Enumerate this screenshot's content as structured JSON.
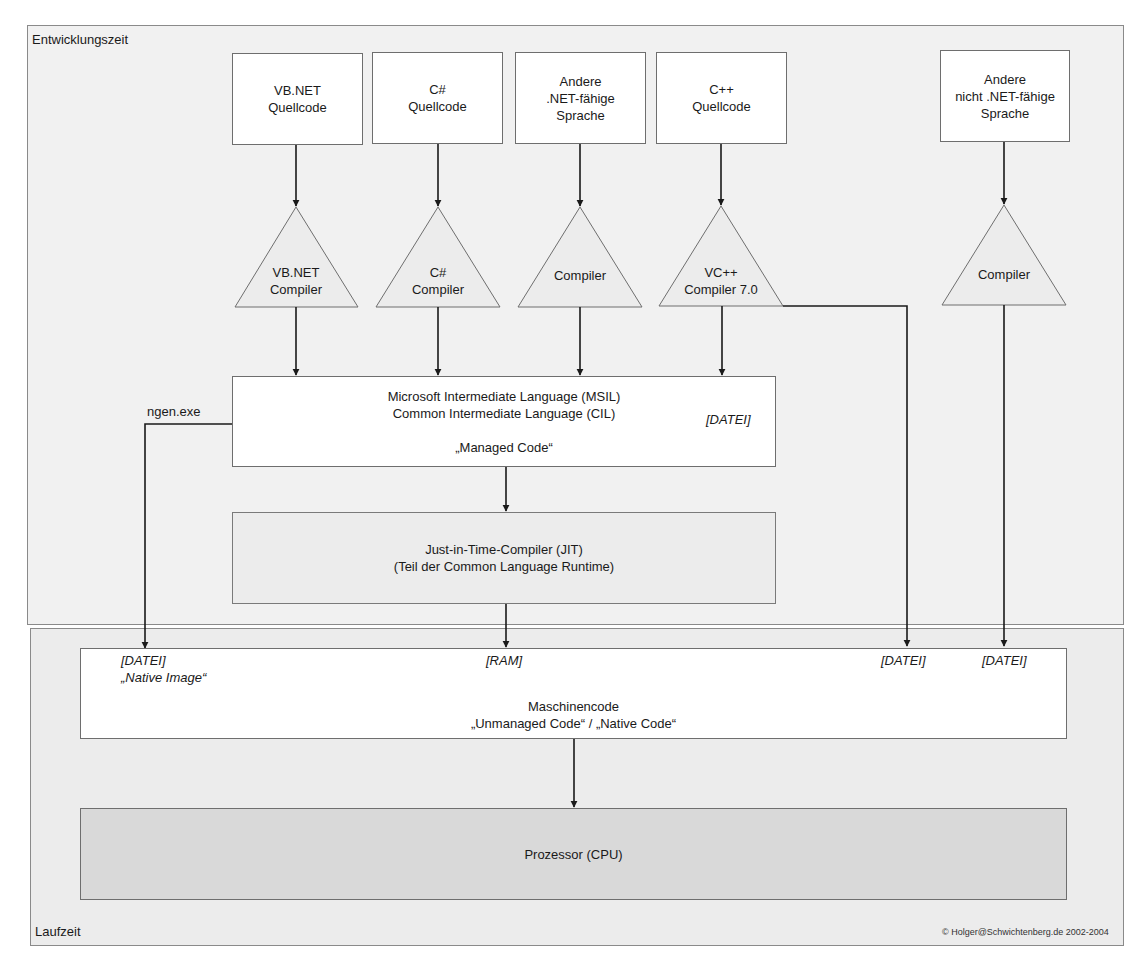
{
  "zones": {
    "development": {
      "label": "Entwicklungszeit"
    },
    "runtime": {
      "label": "Laufzeit"
    }
  },
  "sources": [
    {
      "lines": [
        "VB.NET",
        "Quellcode"
      ]
    },
    {
      "lines": [
        "C#",
        "Quellcode"
      ]
    },
    {
      "lines": [
        "Andere",
        ".NET-fähige",
        "Sprache"
      ]
    },
    {
      "lines": [
        "C++",
        "Quellcode"
      ]
    },
    {
      "lines": [
        "Andere",
        "nicht .NET-fähige",
        "Sprache"
      ]
    }
  ],
  "compilers": [
    {
      "lines": [
        "VB.NET",
        "Compiler"
      ]
    },
    {
      "lines": [
        "C#",
        "Compiler"
      ]
    },
    {
      "lines": [
        "Compiler"
      ]
    },
    {
      "lines": [
        "VC++",
        "Compiler 7.0"
      ]
    },
    {
      "lines": [
        "Compiler"
      ]
    }
  ],
  "msil": {
    "line1": "Microsoft Intermediate Language (MSIL)",
    "line2": "Common Intermediate Language (CIL)",
    "line3": "„Managed Code“",
    "tag": "[DATEI]"
  },
  "ngen_label": "ngen.exe",
  "jit": {
    "line1": "Just-in-Time-Compiler (JIT)",
    "line2": "(Teil der Common Language Runtime)"
  },
  "machine_code": {
    "tag_native": "[DATEI]",
    "native_image": "„Native Image“",
    "tag_ram": "[RAM]",
    "tag_vcpp": "[DATEI]",
    "tag_other": "[DATEI]",
    "line1": "Maschinencode",
    "line2": "„Unmanaged Code“ / „Native Code“"
  },
  "cpu": {
    "label": "Prozessor (CPU)"
  },
  "copyright": "© Holger@Schwichtenberg.de 2002-2004",
  "colors": {
    "zone_bg": "#f1f1f1",
    "runtime_bg": "#ececec",
    "cpu_bg": "#d9d9d9",
    "line": "#1a1a1a",
    "border": "#6e6e6e"
  }
}
